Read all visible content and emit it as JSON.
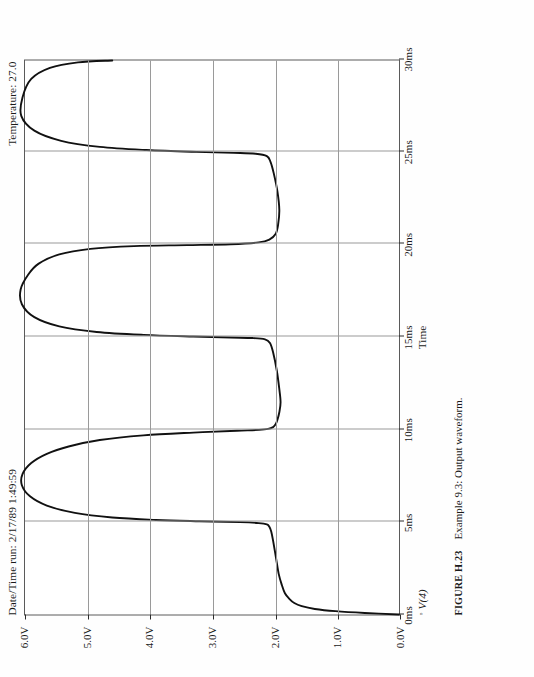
{
  "figure": {
    "label": "FIGURE H.23",
    "caption": "Example 9.3: Output waveform."
  },
  "header": {
    "date_time_run": "Date/Time run:  2/17/89  1:49:59",
    "temperature": "Temperature:  27.0"
  },
  "legend": {
    "marker": "◦",
    "trace": "V(4)"
  },
  "axes": {
    "x_title": "Time",
    "y_title": ""
  },
  "chart_data": {
    "type": "line",
    "title": "",
    "subtitle": "",
    "xlabel": "Time",
    "ylabel": "",
    "xlim": [
      0,
      30
    ],
    "ylim": [
      0,
      6
    ],
    "xunit": "ms",
    "yunit": "V",
    "grid": true,
    "legend_position": "bottom-left",
    "xticks": [
      0,
      5,
      10,
      15,
      20,
      25,
      30
    ],
    "xticklabels": [
      "0ms",
      "5ms",
      "10ms",
      "15ms",
      "20ms",
      "25ms",
      "30ms"
    ],
    "yticks": [
      0,
      1,
      2,
      3,
      4,
      5,
      6
    ],
    "yticklabels": [
      "0.0V",
      "1.0V",
      "2.0V",
      "3.0V",
      "4.0V",
      "5.0V",
      "6.0V"
    ],
    "series": [
      {
        "name": "V(4)",
        "color": "#111111",
        "x": [
          0.0,
          0.08,
          0.18,
          0.3,
          0.45,
          0.62,
          0.85,
          1.15,
          1.6,
          2.2,
          3.0,
          4.0,
          4.5,
          4.75,
          4.88,
          4.95,
          5.0,
          5.05,
          5.12,
          5.25,
          5.5,
          5.9,
          6.4,
          7.0,
          7.6,
          8.2,
          8.7,
          9.1,
          9.45,
          9.7,
          9.85,
          9.95,
          10.0,
          10.05,
          10.15,
          10.3,
          10.55,
          10.95,
          11.5,
          12.2,
          13.2,
          14.2,
          14.7,
          14.9,
          14.97,
          15.0,
          15.05,
          15.14,
          15.3,
          15.6,
          16.1,
          16.8,
          17.6,
          18.4,
          19.0,
          19.5,
          19.8,
          19.95,
          20.0,
          20.05,
          20.15,
          20.3,
          20.6,
          21.1,
          21.9,
          22.9,
          23.9,
          24.5,
          24.82,
          24.95,
          25.0,
          25.05,
          25.15,
          25.32,
          25.65,
          26.2,
          27.0,
          28.0,
          29.0,
          29.6,
          29.9,
          30.0
        ],
        "y": [
          0.0,
          0.55,
          1.02,
          1.35,
          1.56,
          1.68,
          1.76,
          1.83,
          1.88,
          1.93,
          1.97,
          2.02,
          2.05,
          2.08,
          2.12,
          2.25,
          2.55,
          3.2,
          3.9,
          4.6,
          5.2,
          5.65,
          5.92,
          6.05,
          6.04,
          5.9,
          5.65,
          5.3,
          4.8,
          4.1,
          3.3,
          2.6,
          2.25,
          2.1,
          2.02,
          1.98,
          1.95,
          1.92,
          1.9,
          1.92,
          1.96,
          2.02,
          2.07,
          2.15,
          2.35,
          2.7,
          3.3,
          4.1,
          4.85,
          5.45,
          5.85,
          6.05,
          6.07,
          5.95,
          5.78,
          5.45,
          4.95,
          4.25,
          3.4,
          2.7,
          2.25,
          2.08,
          1.98,
          1.94,
          1.92,
          1.95,
          2.01,
          2.06,
          2.12,
          2.3,
          2.65,
          3.25,
          4.05,
          4.8,
          5.42,
          5.85,
          6.06,
          6.04,
          5.9,
          5.6,
          5.15,
          4.6
        ]
      }
    ]
  }
}
